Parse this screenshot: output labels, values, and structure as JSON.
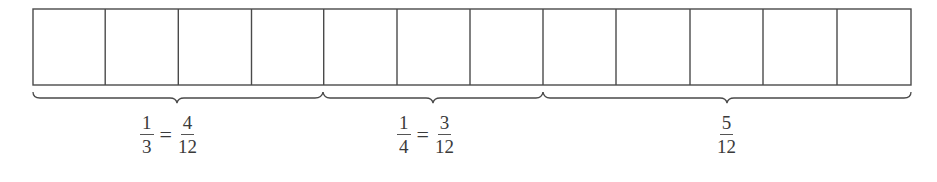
{
  "diagram": {
    "total_parts": 12,
    "stroke_color": "#4a4a4a",
    "groups": [
      {
        "parts": 4,
        "lhs": {
          "num": "1",
          "den": "3"
        },
        "eq": "=",
        "rhs": {
          "num": "4",
          "den": "12"
        }
      },
      {
        "parts": 3,
        "lhs": {
          "num": "1",
          "den": "4"
        },
        "eq": "=",
        "rhs": {
          "num": "3",
          "den": "12"
        }
      },
      {
        "parts": 5,
        "rhs": {
          "num": "5",
          "den": "12"
        }
      }
    ]
  }
}
